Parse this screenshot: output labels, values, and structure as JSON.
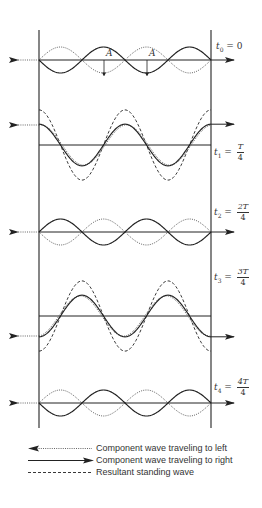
{
  "figure": {
    "pipe": {
      "left_x": 39,
      "right_x": 211,
      "top_y": 30,
      "bottom_y": 428,
      "wavelength_px": 86
    },
    "panels": [
      {
        "id": "t0",
        "time_symbol": "t",
        "subscript": "0",
        "equals": "=",
        "value_text": "0",
        "is_fraction": false,
        "baseline_y": 60,
        "arrow_y": 60,
        "label_x": 216,
        "label_y": 42,
        "resultant_visible": false
      },
      {
        "id": "t1",
        "time_symbol": "t",
        "subscript": "1",
        "equals": "=",
        "numerator": "T",
        "denominator": "4",
        "is_fraction": true,
        "baseline_y": 145,
        "arrow_y": 167,
        "label_x": 214,
        "label_y": 143,
        "resultant_visible": true
      },
      {
        "id": "t2",
        "time_symbol": "t",
        "subscript": "2",
        "equals": "=",
        "numerator": "2T",
        "denominator": "4",
        "is_fraction": true,
        "baseline_y": 232,
        "arrow_y": 232,
        "label_x": 214,
        "label_y": 203,
        "resultant_visible": false
      },
      {
        "id": "t3",
        "time_symbol": "t",
        "subscript": "3",
        "equals": "=",
        "numerator": "3T",
        "denominator": "4",
        "is_fraction": true,
        "baseline_y": 316,
        "arrow_y": 293,
        "label_x": 214,
        "label_y": 268,
        "resultant_visible": true
      },
      {
        "id": "t4",
        "time_symbol": "t",
        "subscript": "4",
        "equals": "=",
        "numerator": "4T",
        "denominator": "4",
        "is_fraction": true,
        "baseline_y": 403,
        "arrow_y": 403,
        "label_x": 214,
        "label_y": 378,
        "resultant_visible": false
      }
    ],
    "amplitude_label": "A",
    "amplitude_markers": [
      {
        "x": 104,
        "label": "A"
      },
      {
        "x": 147,
        "label": "A"
      }
    ]
  },
  "legend": {
    "items": [
      {
        "style": "dotted",
        "arrow": "left",
        "label": "Component wave traveling to left"
      },
      {
        "style": "solid",
        "arrow": "right",
        "label": "Component wave traveling to right"
      },
      {
        "style": "dashed",
        "arrow": "none",
        "label": "Resultant standing wave"
      }
    ]
  },
  "colors": {
    "ink": "#222222",
    "dotted": "#555555",
    "background": "#ffffff"
  }
}
